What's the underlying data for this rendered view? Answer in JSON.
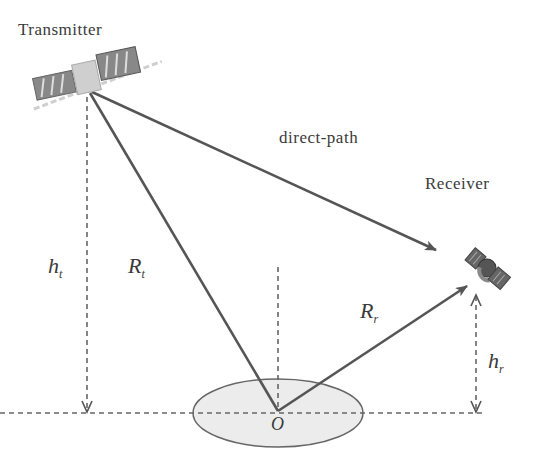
{
  "diagram": {
    "labels": {
      "transmitter": "Transmitter",
      "receiver": "Receiver",
      "direct_path": "direct-path",
      "origin": "O",
      "h_t": {
        "main": "h",
        "sub": "t"
      },
      "R_t": {
        "main": "R",
        "sub": "t"
      },
      "R_r": {
        "main": "R",
        "sub": "r"
      },
      "h_r": {
        "main": "h",
        "sub": "r"
      }
    },
    "nodes": [
      {
        "id": "transmitter",
        "type": "satellite",
        "x": 88,
        "y": 93
      },
      {
        "id": "receiver",
        "type": "satellite",
        "x": 485,
        "y": 270
      },
      {
        "id": "origin",
        "type": "point",
        "x": 278,
        "y": 411
      }
    ],
    "edges": [
      {
        "from": "transmitter",
        "to": "receiver",
        "label": "direct-path",
        "style": "solid-arrow"
      },
      {
        "from": "transmitter",
        "to": "origin",
        "label": "R_t",
        "style": "solid"
      },
      {
        "from": "origin",
        "to": "receiver",
        "label": "R_r",
        "style": "solid-arrow"
      },
      {
        "from": "transmitter",
        "to": "ground",
        "label": "h_t",
        "style": "dashed-arrow"
      },
      {
        "from": "receiver",
        "to": "ground",
        "label": "h_r",
        "style": "dashed-double-arrow"
      }
    ],
    "colors": {
      "line": "#555555",
      "ellipse_fill": "#ececec",
      "ellipse_stroke": "#666666",
      "text": "#3a3a3a"
    }
  }
}
